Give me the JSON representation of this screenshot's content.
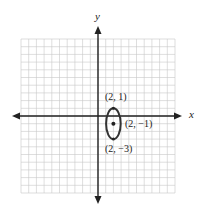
{
  "figure": {
    "type": "coordinate-plane-ellipse",
    "axes": {
      "x_label": "x",
      "y_label": "y",
      "x_range": [
        -10,
        10
      ],
      "y_range": [
        -10,
        10
      ],
      "grid": true
    },
    "ellipse": {
      "center": [
        2,
        -1
      ],
      "vertices": [
        [
          2,
          1
        ],
        [
          2,
          -3
        ]
      ],
      "semi_major_axis": 2,
      "semi_minor_axis": 1,
      "orientation": "vertical"
    },
    "labels": {
      "top_vertex": "(2, 1)",
      "center": "(2, −1)",
      "bottom_vertex": "(2, −3)"
    },
    "colors": {
      "grid": "#c8c8c8",
      "axis": "#222222",
      "ellipse": "#333333"
    }
  }
}
